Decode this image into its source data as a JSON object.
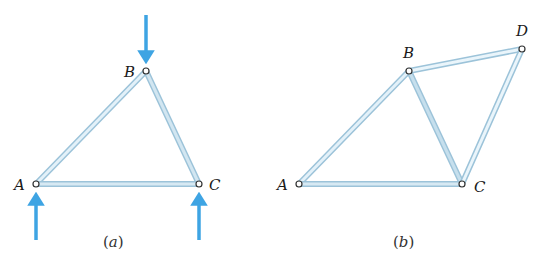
{
  "colors": {
    "member_fill": "#e3f1f9",
    "member_edge": "#9cc3d9",
    "member_shade": "#b9d6e6",
    "pin_stroke": "#333333",
    "force_arrow": "#3ea4e3",
    "text": "#1a1a1a"
  },
  "figures": [
    {
      "id": "a",
      "caption": "(a)",
      "caption_letter": "a",
      "nodes": [
        {
          "label": "A",
          "x": 36,
          "y": 184
        },
        {
          "label": "B",
          "x": 146,
          "y": 71
        },
        {
          "label": "C",
          "x": 199,
          "y": 184
        }
      ],
      "members": [
        [
          "A",
          "B"
        ],
        [
          "B",
          "C"
        ],
        [
          "A",
          "C"
        ]
      ],
      "forces": [
        {
          "node": "B",
          "direction": "down",
          "from": [
            146,
            15
          ],
          "to": [
            146,
            64
          ]
        },
        {
          "node": "A",
          "direction": "up",
          "from": [
            36,
            240
          ],
          "to": [
            36,
            192
          ]
        },
        {
          "node": "C",
          "direction": "up",
          "from": [
            199,
            240
          ],
          "to": [
            199,
            192
          ]
        }
      ]
    },
    {
      "id": "b",
      "caption": "(b)",
      "caption_letter": "b",
      "nodes": [
        {
          "label": "A",
          "x": 299,
          "y": 184
        },
        {
          "label": "B",
          "x": 409,
          "y": 71
        },
        {
          "label": "C",
          "x": 462,
          "y": 184
        },
        {
          "label": "D",
          "x": 522,
          "y": 49
        }
      ],
      "members": [
        [
          "A",
          "B"
        ],
        [
          "B",
          "C"
        ],
        [
          "A",
          "C"
        ],
        [
          "B",
          "D"
        ],
        [
          "C",
          "D"
        ]
      ],
      "forces": []
    }
  ]
}
